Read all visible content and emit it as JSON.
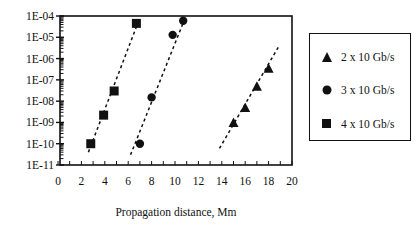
{
  "chart_data": {
    "type": "scatter",
    "title": "",
    "xlabel": "Propagation distance, Mm",
    "ylabel": "",
    "xlim": [
      0,
      20
    ],
    "ylim": [
      1e-11,
      0.0001
    ],
    "yscale": "log",
    "grid": false,
    "legend_position": "right",
    "x_ticks": [
      "0",
      "2",
      "4",
      "6",
      "8",
      "10",
      "12",
      "14",
      "16",
      "18",
      "20"
    ],
    "y_ticks": [
      "1E-04",
      "1E-05",
      "1E-06",
      "1E-07",
      "1E-08",
      "1E-09",
      "1E-10",
      "1E-11"
    ],
    "series": [
      {
        "name": "2 x 10 Gb/s",
        "marker": "triangle",
        "x": [
          15,
          16,
          17,
          18
        ],
        "y": [
          1e-09,
          5e-09,
          5e-08,
          3.5e-07
        ],
        "fit_line": {
          "x": [
            13.8,
            18.9
          ],
          "y": [
            6e-11,
            4e-06
          ]
        }
      },
      {
        "name": "3 x 10 Gb/s",
        "marker": "circle",
        "x": [
          7,
          8,
          9.8,
          10.7
        ],
        "y": [
          1e-10,
          1.5e-08,
          1.3e-05,
          6e-05
        ],
        "fit_line": {
          "x": [
            6.2,
            10.9
          ],
          "y": [
            3e-11,
            9e-05
          ]
        }
      },
      {
        "name": "4 x 10 Gb/s",
        "marker": "square",
        "x": [
          2.8,
          3.9,
          4.8,
          6.7
        ],
        "y": [
          1e-10,
          2.2e-09,
          3e-08,
          4.5e-05
        ],
        "fit_line": {
          "x": [
            2.6,
            6.9
          ],
          "y": [
            4e-11,
            6e-05
          ]
        }
      }
    ]
  },
  "legend": {
    "items": [
      {
        "label": "2 x 10 Gb/s",
        "marker": "triangle"
      },
      {
        "label": "3 x 10 Gb/s",
        "marker": "circle"
      },
      {
        "label": "4 x 10 Gb/s",
        "marker": "square"
      }
    ]
  },
  "axes": {
    "xlabel": "Propagation distance, Mm"
  }
}
